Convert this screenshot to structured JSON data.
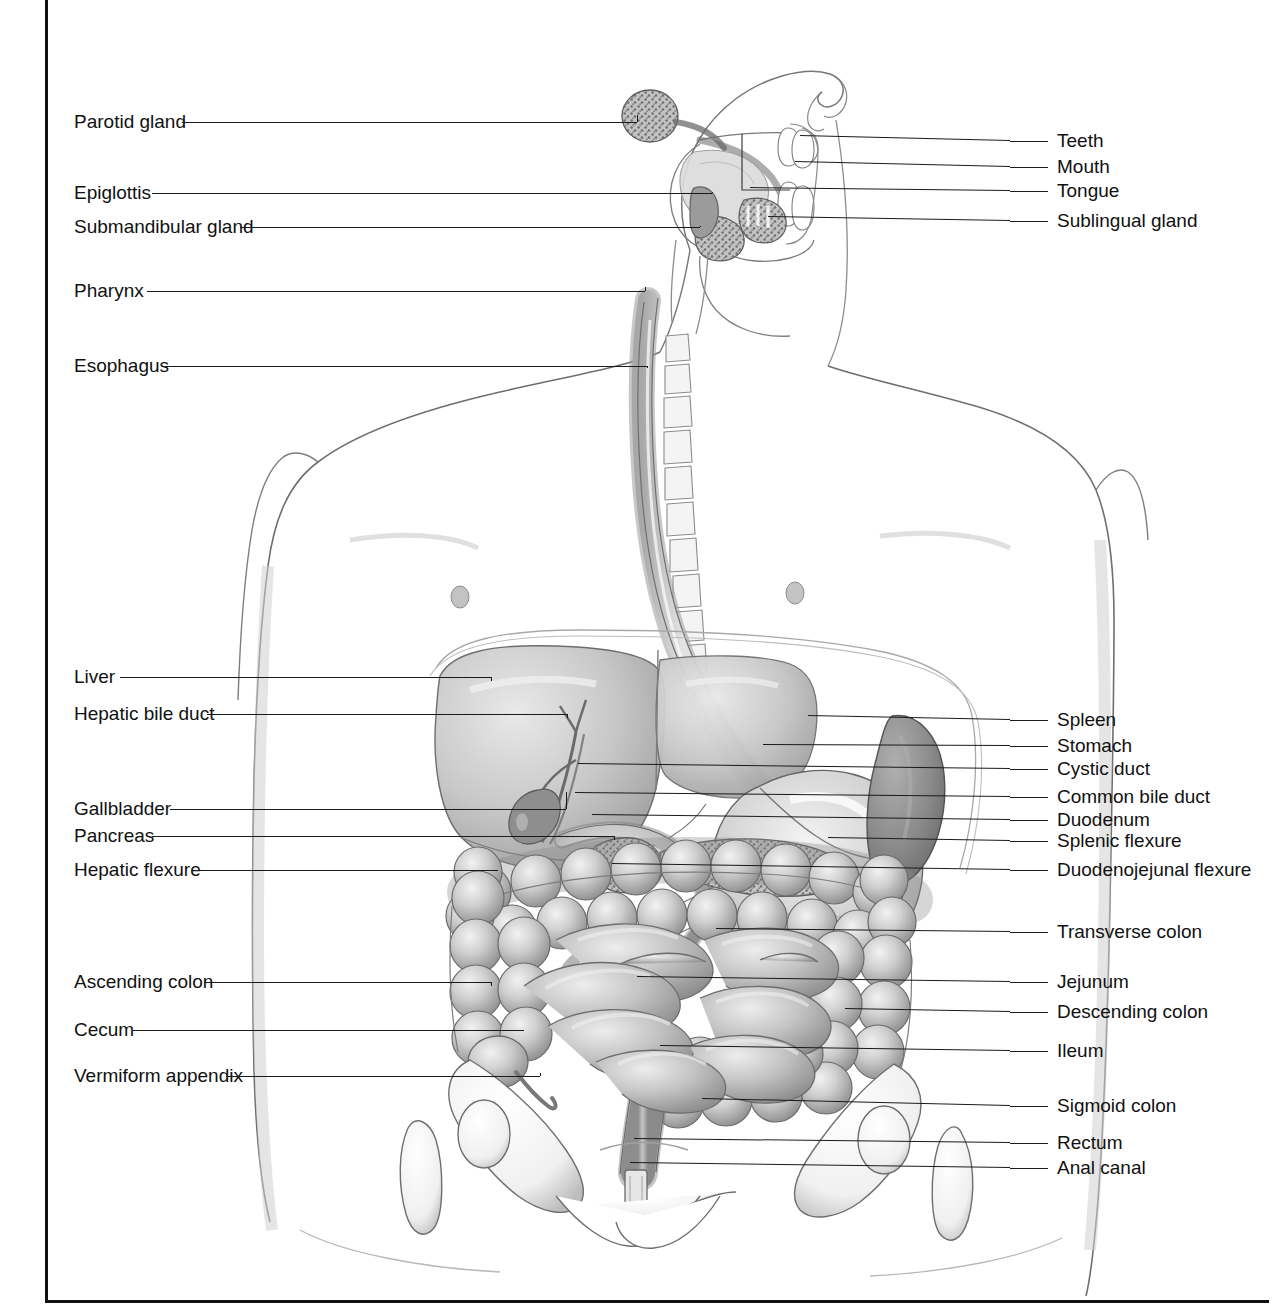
{
  "figure": {
    "kind": "anatomical-illustration",
    "style": "grayscale pencil / airbrush medical illustration, labelled with horizontal leader lines",
    "border_color": "#111111",
    "background_color": "#ffffff",
    "ink_color": "#1a1a1a"
  },
  "labels_left": [
    {
      "id": "parotid-gland",
      "text": "Parotid gland",
      "text_x": 74,
      "y": 122,
      "line_x1": 182,
      "line_x2": 637,
      "target_x": 637,
      "target_y": 115
    },
    {
      "id": "epiglottis",
      "text": "Epiglottis",
      "text_x": 74,
      "y": 193,
      "line_x1": 152,
      "line_x2": 712,
      "target_x": 712,
      "target_y": 192
    },
    {
      "id": "submandibular-gland",
      "text": "Submandibular gland",
      "text_x": 74,
      "y": 227,
      "line_x1": 240,
      "line_x2": 700,
      "target_x": 700,
      "target_y": 226
    },
    {
      "id": "pharynx",
      "text": "Pharynx",
      "text_x": 74,
      "y": 291,
      "line_x1": 147,
      "line_x2": 645,
      "target_x": 645,
      "target_y": 287
    },
    {
      "id": "esophagus",
      "text": "Esophagus",
      "text_x": 74,
      "y": 366,
      "line_x1": 165,
      "line_x2": 648,
      "target_x": 648,
      "target_y": 368
    },
    {
      "id": "liver",
      "text": "Liver",
      "text_x": 74,
      "y": 677,
      "line_x1": 120,
      "line_x2": 492,
      "target_x": 492,
      "target_y": 681
    },
    {
      "id": "hepatic-bile-duct",
      "text": "Hepatic bile duct",
      "text_x": 74,
      "y": 714,
      "line_x1": 207,
      "line_x2": 568,
      "target_x": 568,
      "target_y": 718
    },
    {
      "id": "gallbladder",
      "text": "Gallbladder",
      "text_x": 74,
      "y": 809,
      "line_x1": 170,
      "line_x2": 566,
      "target_x": 566,
      "target_y": 792
    },
    {
      "id": "pancreas",
      "text": "Pancreas",
      "text_x": 74,
      "y": 836,
      "line_x1": 152,
      "line_x2": 615,
      "target_x": 615,
      "target_y": 840
    },
    {
      "id": "hepatic-flexure",
      "text": "Hepatic flexure",
      "text_x": 74,
      "y": 870,
      "line_x1": 192,
      "line_x2": 498,
      "target_x": 498,
      "target_y": 870
    },
    {
      "id": "ascending-colon",
      "text": "Ascending colon",
      "text_x": 74,
      "y": 982,
      "line_x1": 204,
      "line_x2": 492,
      "target_x": 492,
      "target_y": 986
    },
    {
      "id": "cecum",
      "text": "Cecum",
      "text_x": 74,
      "y": 1030,
      "line_x1": 133,
      "line_x2": 524,
      "target_x": 524,
      "target_y": 1031
    },
    {
      "id": "vermiform-appendix",
      "text": "Vermiform appendix",
      "text_x": 74,
      "y": 1076,
      "line_x1": 226,
      "line_x2": 540,
      "target_x": 540,
      "target_y": 1073
    }
  ],
  "labels_right": [
    {
      "id": "teeth",
      "text": "Teeth",
      "text_x": 1057,
      "y": 141,
      "line_x1": 1010,
      "line_x2": 1048,
      "target_x": 800,
      "target_y": 136
    },
    {
      "id": "mouth",
      "text": "Mouth",
      "text_x": 1057,
      "y": 167,
      "line_x1": 1010,
      "line_x2": 1048,
      "target_x": 795,
      "target_y": 162
    },
    {
      "id": "tongue",
      "text": "Tongue",
      "text_x": 1057,
      "y": 191,
      "line_x1": 1010,
      "line_x2": 1048,
      "target_x": 750,
      "target_y": 188
    },
    {
      "id": "sublingual-gland",
      "text": "Sublingual gland",
      "text_x": 1057,
      "y": 221,
      "line_x1": 1010,
      "line_x2": 1048,
      "target_x": 768,
      "target_y": 217
    },
    {
      "id": "spleen",
      "text": "Spleen",
      "text_x": 1057,
      "y": 720,
      "line_x1": 1010,
      "line_x2": 1048,
      "target_x": 808,
      "target_y": 716
    },
    {
      "id": "stomach",
      "text": "Stomach",
      "text_x": 1057,
      "y": 746,
      "line_x1": 1010,
      "line_x2": 1048,
      "target_x": 763,
      "target_y": 745
    },
    {
      "id": "cystic-duct",
      "text": "Cystic duct",
      "text_x": 1057,
      "y": 769,
      "line_x1": 1010,
      "line_x2": 1048,
      "target_x": 578,
      "target_y": 764
    },
    {
      "id": "common-bile-duct",
      "text": "Common bile duct",
      "text_x": 1057,
      "y": 797,
      "line_x1": 1010,
      "line_x2": 1048,
      "target_x": 575,
      "target_y": 793
    },
    {
      "id": "duodenum",
      "text": "Duodenum",
      "text_x": 1057,
      "y": 820,
      "line_x1": 1010,
      "line_x2": 1048,
      "target_x": 592,
      "target_y": 815
    },
    {
      "id": "splenic-flexure",
      "text": "Splenic flexure",
      "text_x": 1057,
      "y": 841,
      "line_x1": 1010,
      "line_x2": 1048,
      "target_x": 828,
      "target_y": 838
    },
    {
      "id": "duodenojejunal-flexure",
      "text": "Duodenojejunal flexure",
      "text_x": 1057,
      "y": 870,
      "line_x1": 1010,
      "line_x2": 1048,
      "target_x": 612,
      "target_y": 864
    },
    {
      "id": "transverse-colon",
      "text": "Transverse colon",
      "text_x": 1057,
      "y": 932,
      "line_x1": 1010,
      "line_x2": 1048,
      "target_x": 716,
      "target_y": 929
    },
    {
      "id": "jejunum",
      "text": "Jejunum",
      "text_x": 1057,
      "y": 982,
      "line_x1": 1010,
      "line_x2": 1048,
      "target_x": 637,
      "target_y": 977
    },
    {
      "id": "descending-colon",
      "text": "Descending colon",
      "text_x": 1057,
      "y": 1012,
      "line_x1": 1010,
      "line_x2": 1048,
      "target_x": 845,
      "target_y": 1009
    },
    {
      "id": "ileum",
      "text": "Ileum",
      "text_x": 1057,
      "y": 1051,
      "line_x1": 1010,
      "line_x2": 1048,
      "target_x": 660,
      "target_y": 1046
    },
    {
      "id": "sigmoid-colon",
      "text": "Sigmoid colon",
      "text_x": 1057,
      "y": 1106,
      "line_x1": 1010,
      "line_x2": 1048,
      "target_x": 702,
      "target_y": 1099
    },
    {
      "id": "rectum",
      "text": "Rectum",
      "text_x": 1057,
      "y": 1143,
      "line_x1": 1010,
      "line_x2": 1048,
      "target_x": 634,
      "target_y": 1139
    },
    {
      "id": "anal-canal",
      "text": "Anal canal",
      "text_x": 1057,
      "y": 1168,
      "line_x1": 1010,
      "line_x2": 1048,
      "target_x": 630,
      "target_y": 1163
    }
  ],
  "structures": [
    "Parotid gland",
    "Teeth",
    "Mouth",
    "Tongue",
    "Sublingual gland",
    "Epiglottis",
    "Submandibular gland",
    "Pharynx",
    "Esophagus",
    "Liver",
    "Hepatic bile duct",
    "Spleen",
    "Stomach",
    "Cystic duct",
    "Common bile duct",
    "Gallbladder",
    "Duodenum",
    "Pancreas",
    "Splenic flexure",
    "Hepatic flexure",
    "Duodenojejunal flexure",
    "Transverse colon",
    "Ascending colon",
    "Descending colon",
    "Jejunum",
    "Ileum",
    "Cecum",
    "Vermiform appendix",
    "Sigmoid colon",
    "Rectum",
    "Anal canal"
  ]
}
